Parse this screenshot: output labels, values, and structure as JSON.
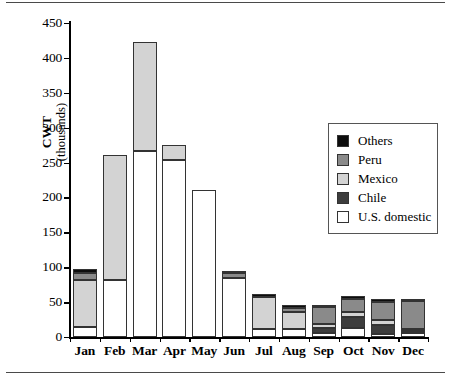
{
  "chart_data": {
    "type": "bar",
    "subtype": "stacked",
    "title": "",
    "xlabel": "",
    "ylabel": "CWT",
    "ylabel_sub": "(thousands)",
    "ylim": [
      0,
      450
    ],
    "yticks": [
      0,
      50,
      100,
      150,
      200,
      250,
      300,
      350,
      400,
      450
    ],
    "grid": false,
    "legend_position": "inside-right",
    "categories": [
      "Jan",
      "Feb",
      "Mar",
      "Apr",
      "May",
      "Jun",
      "Jul",
      "Aug",
      "Sep",
      "Oct",
      "Nov",
      "Dec"
    ],
    "series": [
      {
        "name": "U.S. domestic",
        "color": "#ffffff",
        "values": [
          14,
          81,
          266,
          254,
          211,
          84,
          12,
          11,
          6,
          13,
          5,
          6
        ]
      },
      {
        "name": "Chile",
        "color": "#3d3d3d",
        "values": [
          0,
          0,
          0,
          0,
          0,
          0,
          0,
          0,
          7,
          16,
          12,
          2
        ]
      },
      {
        "name": "Mexico",
        "color": "#d3d3d3",
        "values": [
          68,
          180,
          157,
          21,
          0,
          0,
          45,
          25,
          6,
          7,
          7,
          3
        ]
      },
      {
        "name": "Peru",
        "color": "#8a8a8a",
        "values": [
          10,
          0,
          0,
          0,
          0,
          8,
          0,
          6,
          24,
          19,
          26,
          40
        ]
      },
      {
        "name": "Others",
        "color": "#0d0d0d",
        "values": [
          5,
          0,
          0,
          0,
          0,
          2,
          5,
          4,
          3,
          4,
          5,
          3
        ]
      }
    ],
    "totals": [
      97,
      261,
      423,
      275,
      211,
      94,
      62,
      46,
      46,
      59,
      55,
      54
    ]
  },
  "legend": {
    "entries": [
      {
        "label": "Others",
        "swatch": "others"
      },
      {
        "label": "Peru",
        "swatch": "peru"
      },
      {
        "label": "Mexico",
        "swatch": "mexico"
      },
      {
        "label": "Chile",
        "swatch": "chile"
      },
      {
        "label": "U.S. domestic",
        "swatch": "us"
      }
    ]
  }
}
